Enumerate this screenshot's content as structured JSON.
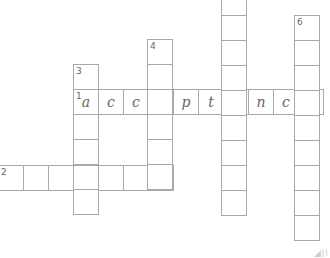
{
  "puzzle": {
    "cell_size": 25,
    "letters_row1": [
      "a",
      "c",
      "c",
      "e",
      "p",
      "t",
      "a",
      "n",
      "c",
      "e"
    ],
    "words": [
      {
        "number": "1",
        "direction": "across",
        "answer": "acceptance",
        "x": 73,
        "y": 89,
        "length": 10
      },
      {
        "number": "2",
        "direction": "across",
        "answer": "",
        "x": -2,
        "y": 165,
        "length": 7
      },
      {
        "number": "3",
        "direction": "down",
        "answer": "",
        "x": 73,
        "y": 64,
        "length": 6
      },
      {
        "number": "4",
        "direction": "down",
        "answer": "",
        "x": 147,
        "y": 39,
        "length": 6
      },
      {
        "number": "5",
        "direction": "down",
        "answer": "",
        "x": 221,
        "y": -10,
        "length": 9
      },
      {
        "number": "6",
        "direction": "down",
        "answer": "",
        "x": 294,
        "y": 15,
        "length": 9
      }
    ]
  },
  "footer": {
    "mark": "◢))"
  }
}
